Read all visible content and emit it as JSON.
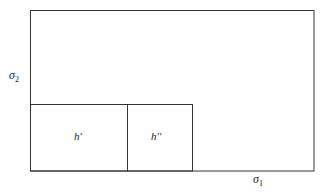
{
  "diagram": {
    "axis_labels": {
      "vertical": {
        "base": "σ",
        "subscript": "2"
      },
      "horizontal": {
        "base": "σ",
        "subscript": "1"
      }
    },
    "regions": [
      {
        "id": "h-prime",
        "label": "h′"
      },
      {
        "id": "h-double-prime",
        "label": "h′′"
      }
    ],
    "line_color": "#333333"
  }
}
